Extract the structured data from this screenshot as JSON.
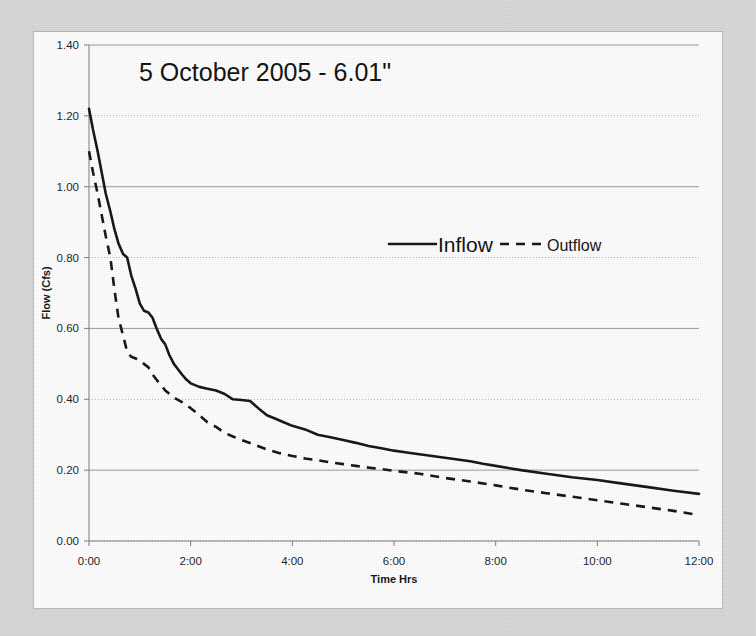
{
  "chart_data": {
    "type": "line",
    "title": "5 October 2005 - 6.01\"",
    "xlabel": "Time Hrs",
    "ylabel": "Flow (Cfs)",
    "xlim": [
      0,
      12
    ],
    "ylim": [
      0.0,
      1.4
    ],
    "grid": true,
    "legend_position": "inside-upper-center",
    "y_ticks": [
      "0.00",
      "0.20",
      "0.40",
      "0.60",
      "0.80",
      "1.00",
      "1.20",
      "1.40"
    ],
    "y_tick_values": [
      0.0,
      0.2,
      0.4,
      0.6,
      0.8,
      1.0,
      1.2,
      1.4
    ],
    "x_ticks": [
      "0:00",
      "2:00",
      "4:00",
      "6:00",
      "8:00",
      "10:00",
      "12:00"
    ],
    "x_tick_values": [
      0,
      2,
      4,
      6,
      8,
      10,
      12
    ],
    "series": [
      {
        "name": "Inflow",
        "style": "solid",
        "color": "#111111",
        "x": [
          0.0,
          0.08,
          0.17,
          0.25,
          0.33,
          0.42,
          0.5,
          0.58,
          0.67,
          0.75,
          0.83,
          0.92,
          1.0,
          1.08,
          1.17,
          1.25,
          1.33,
          1.42,
          1.5,
          1.58,
          1.67,
          1.75,
          1.83,
          1.92,
          2.0,
          2.17,
          2.33,
          2.5,
          2.67,
          2.83,
          3.0,
          3.17,
          3.33,
          3.5,
          3.67,
          3.83,
          4.0,
          4.25,
          4.5,
          4.75,
          5.0,
          5.25,
          5.5,
          5.75,
          6.0,
          6.25,
          6.5,
          6.75,
          7.0,
          7.25,
          7.5,
          7.75,
          8.0,
          8.5,
          9.0,
          9.5,
          10.0,
          10.5,
          11.0,
          11.5,
          12.0
        ],
        "y": [
          1.22,
          1.16,
          1.1,
          1.04,
          0.98,
          0.93,
          0.88,
          0.84,
          0.81,
          0.8,
          0.75,
          0.71,
          0.67,
          0.65,
          0.645,
          0.63,
          0.6,
          0.57,
          0.555,
          0.525,
          0.5,
          0.485,
          0.47,
          0.455,
          0.445,
          0.435,
          0.43,
          0.425,
          0.415,
          0.4,
          0.398,
          0.395,
          0.375,
          0.355,
          0.345,
          0.335,
          0.325,
          0.315,
          0.3,
          0.293,
          0.285,
          0.277,
          0.268,
          0.262,
          0.255,
          0.25,
          0.245,
          0.24,
          0.235,
          0.23,
          0.225,
          0.218,
          0.212,
          0.2,
          0.19,
          0.18,
          0.172,
          0.162,
          0.152,
          0.142,
          0.133
        ]
      },
      {
        "name": "Outflow",
        "style": "dashed",
        "color": "#111111",
        "x": [
          0.0,
          0.08,
          0.17,
          0.25,
          0.33,
          0.42,
          0.5,
          0.58,
          0.67,
          0.75,
          0.83,
          0.92,
          1.0,
          1.08,
          1.17,
          1.25,
          1.33,
          1.42,
          1.5,
          1.67,
          1.83,
          2.0,
          2.17,
          2.33,
          2.5,
          2.67,
          2.83,
          3.0,
          3.25,
          3.5,
          3.75,
          4.0,
          4.25,
          4.5,
          4.75,
          5.0,
          5.25,
          5.5,
          5.75,
          6.0,
          6.5,
          7.0,
          7.5,
          8.0,
          8.5,
          9.0,
          9.5,
          10.0,
          10.5,
          11.0,
          11.5,
          12.0
        ],
        "y": [
          1.1,
          1.04,
          0.98,
          0.92,
          0.86,
          0.8,
          0.71,
          0.63,
          0.58,
          0.535,
          0.52,
          0.515,
          0.51,
          0.5,
          0.49,
          0.47,
          0.455,
          0.44,
          0.425,
          0.405,
          0.392,
          0.375,
          0.355,
          0.335,
          0.322,
          0.305,
          0.295,
          0.285,
          0.272,
          0.258,
          0.248,
          0.24,
          0.233,
          0.228,
          0.222,
          0.217,
          0.212,
          0.207,
          0.203,
          0.198,
          0.19,
          0.178,
          0.168,
          0.157,
          0.145,
          0.135,
          0.125,
          0.115,
          0.105,
          0.095,
          0.085,
          0.073
        ]
      }
    ]
  },
  "legend": {
    "inflow_label": "Inflow",
    "outflow_label": "Outflow"
  }
}
